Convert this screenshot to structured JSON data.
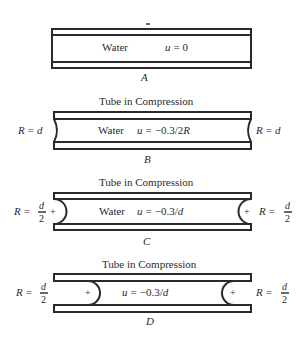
{
  "panels": [
    {
      "id": "A",
      "label": "A",
      "title": "",
      "fluid_label": "Water",
      "equation": "u = 0",
      "radius_left": "",
      "radius_right": "",
      "end_shape": "flat"
    },
    {
      "id": "B",
      "label": "B",
      "title": "Tube in Compression",
      "fluid_label": "Water",
      "equation": "u = −0.3/2R",
      "radius_left": "R = d",
      "radius_right": "R = d",
      "end_shape": "shallow-concave"
    },
    {
      "id": "C",
      "label": "C",
      "title": "Tube in Compression",
      "fluid_label": "Water",
      "equation": "u = −0.3/d",
      "radius_left": "R = d/2",
      "radius_right": "R = d/2",
      "sign_left": "+",
      "sign_right": "+",
      "end_shape": "hemispherical"
    },
    {
      "id": "D",
      "label": "D",
      "title": "Tube in Compression",
      "fluid_label": "",
      "equation": "u = −0.3/d",
      "radius_left": "R = d/2",
      "radius_right": "R = d/2",
      "sign_left": "+",
      "sign_right": "+",
      "end_shape": "hemispherical-retracted"
    }
  ],
  "text": {
    "a_water": "Water",
    "a_eq": "u = 0",
    "a_label": "A",
    "b_title": "Tube in Compression",
    "b_water": "Water",
    "b_eq_u": "u",
    "b_eq_rest": "= −0.3/2",
    "b_eq_R": "R",
    "b_left_R": "R",
    "b_left_rest": "= d",
    "b_right_R": "R",
    "b_right_rest": "= d",
    "b_label": "B",
    "c_title": "Tube in Compression",
    "c_water": "Water",
    "c_eq_u": "u",
    "c_eq_rest": "= −0.3/",
    "c_eq_d": "d",
    "c_left_R": "R =",
    "c_frac_num": "d",
    "c_frac_den": "2",
    "c_plus": "+",
    "c_label": "C",
    "d_title": "Tube in Compression",
    "d_eq_u": "u",
    "d_eq_rest": "= −0.3/",
    "d_eq_d": "d",
    "d_left_R": "R =",
    "d_frac_num": "d",
    "d_frac_den": "2",
    "d_plus": "+",
    "d_label": "D"
  }
}
